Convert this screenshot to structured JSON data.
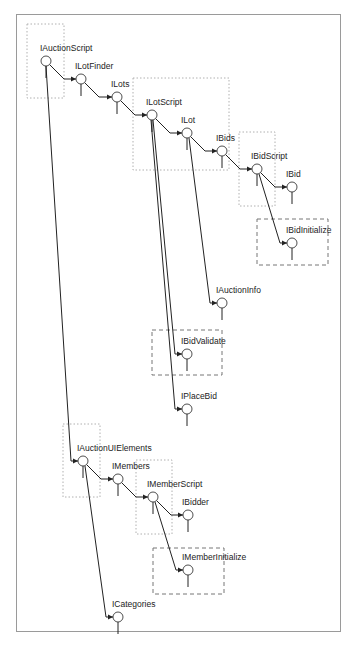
{
  "diagram": {
    "colors": {
      "line": "#222222",
      "frame": "#9a9a9a",
      "dotted": "#b0b0b0",
      "dashed": "#777777"
    },
    "nodes": [
      {
        "id": "IAuctionScript",
        "label": "IAuctionScript",
        "x": 46,
        "y": 61
      },
      {
        "id": "ILotFinder",
        "label": "ILotFinder",
        "x": 81,
        "y": 79
      },
      {
        "id": "ILots",
        "label": "ILots",
        "x": 117,
        "y": 97
      },
      {
        "id": "ILotScript",
        "label": "ILotScript",
        "x": 152,
        "y": 115
      },
      {
        "id": "ILot",
        "label": "ILot",
        "x": 187,
        "y": 133
      },
      {
        "id": "IBids",
        "label": "IBids",
        "x": 222,
        "y": 151
      },
      {
        "id": "IBidScript",
        "label": "IBidScript",
        "x": 257,
        "y": 169
      },
      {
        "id": "IBid",
        "label": "IBid",
        "x": 292,
        "y": 187
      },
      {
        "id": "IBidInitialize",
        "label": "IBidInitialize",
        "x": 292,
        "y": 243
      },
      {
        "id": "IAuctionInfo",
        "label": "IAuctionInfo",
        "x": 222,
        "y": 303
      },
      {
        "id": "IBidValidate",
        "label": "IBidValidate",
        "x": 187,
        "y": 354
      },
      {
        "id": "IPlaceBid",
        "label": "IPlaceBid",
        "x": 187,
        "y": 409
      },
      {
        "id": "IAuctionUIElements",
        "label": "IAuctionUIElements",
        "x": 83,
        "y": 461
      },
      {
        "id": "IMembers",
        "label": "IMembers",
        "x": 118,
        "y": 479
      },
      {
        "id": "IMemberScript",
        "label": "IMemberScript",
        "x": 153,
        "y": 497
      },
      {
        "id": "IBidder",
        "label": "IBidder",
        "x": 188,
        "y": 515
      },
      {
        "id": "IMemberInitialize",
        "label": "IMemberInitialize",
        "x": 188,
        "y": 570
      },
      {
        "id": "ICategories",
        "label": "ICategories",
        "x": 118,
        "y": 617
      }
    ],
    "edges": [
      {
        "from": "IAuctionScript",
        "to": "ILotFinder",
        "kind": "diag"
      },
      {
        "from": "ILotFinder",
        "to": "ILots",
        "kind": "diag"
      },
      {
        "from": "ILots",
        "to": "ILotScript",
        "kind": "diag"
      },
      {
        "from": "ILotScript",
        "to": "ILot",
        "kind": "diag"
      },
      {
        "from": "ILot",
        "to": "IBids",
        "kind": "diag"
      },
      {
        "from": "IBids",
        "to": "IBidScript",
        "kind": "diag"
      },
      {
        "from": "IBidScript",
        "to": "IBid",
        "kind": "diag"
      },
      {
        "from": "IBidScript",
        "to": "IBidInitialize",
        "kind": "drop",
        "dx": 2
      },
      {
        "from": "ILot",
        "to": "IAuctionInfo",
        "kind": "drop",
        "dx": 2
      },
      {
        "from": "ILotScript",
        "to": "IBidValidate",
        "kind": "drop",
        "dx": 1
      },
      {
        "from": "ILotScript",
        "to": "IPlaceBid",
        "kind": "drop",
        "dx": -1
      },
      {
        "from": "IAuctionScript",
        "to": "IAuctionUIElements",
        "kind": "drop",
        "dx": 0
      },
      {
        "from": "IAuctionUIElements",
        "to": "IMembers",
        "kind": "diag"
      },
      {
        "from": "IMembers",
        "to": "IMemberScript",
        "kind": "diag"
      },
      {
        "from": "IMemberScript",
        "to": "IBidder",
        "kind": "diag"
      },
      {
        "from": "IMemberScript",
        "to": "IMemberInitialize",
        "kind": "drop",
        "dx": 2
      },
      {
        "from": "IAuctionUIElements",
        "to": "ICategories",
        "kind": "drop",
        "dx": 2
      }
    ],
    "dotted_boxes": [
      {
        "name": "auction-script-group",
        "x": 27,
        "y": 24,
        "w": 37,
        "h": 74
      },
      {
        "name": "lot-script-group",
        "x": 133,
        "y": 78,
        "w": 96,
        "h": 92
      },
      {
        "name": "bid-script-group",
        "x": 239,
        "y": 132,
        "w": 36,
        "h": 74
      },
      {
        "name": "ui-elements-group",
        "x": 63,
        "y": 424,
        "w": 37,
        "h": 73
      },
      {
        "name": "member-script-group",
        "x": 136,
        "y": 460,
        "w": 36,
        "h": 74
      }
    ],
    "dashed_boxes": [
      {
        "name": "bid-initialize-box",
        "x": 257,
        "y": 219,
        "w": 71,
        "h": 46
      },
      {
        "name": "bid-validate-box",
        "x": 152,
        "y": 330,
        "w": 70,
        "h": 45
      },
      {
        "name": "member-initialize-box",
        "x": 153,
        "y": 548,
        "w": 71,
        "h": 46
      }
    ]
  }
}
